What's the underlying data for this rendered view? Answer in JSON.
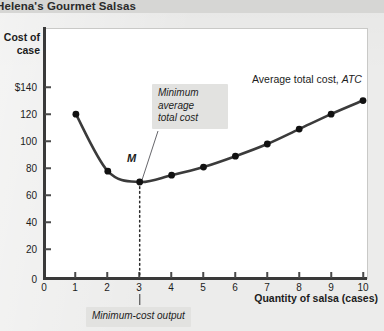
{
  "title": "Helena's Gourmet Salsas",
  "axes": {
    "y_title_line1": "Cost of",
    "y_title_line2": "case",
    "x_title": "Quantity of salsa (cases)",
    "y_ticks": [
      "$140",
      "120",
      "100",
      "80",
      "60",
      "40",
      "20",
      "0"
    ],
    "x_ticks": [
      "0",
      "1",
      "2",
      "3",
      "4",
      "5",
      "6",
      "7",
      "8",
      "9",
      "10"
    ]
  },
  "annotations": {
    "curve_label_plain": "Average total cost, ",
    "curve_label_italic": "ATC",
    "minimum_callout": "Minimum\naverage\ntotal cost",
    "point_label": "M",
    "min_output_callout": "Minimum-cost output"
  },
  "colors": {
    "page_background": "#ececeb",
    "title_bar": "#d6d6d4",
    "plot_background": "#ffffff",
    "curve": "#3b3b3b",
    "marker": "#111111",
    "axis": "#3a3a3a",
    "callout_background": "#e2e2e0"
  },
  "chart_data": {
    "type": "line",
    "title": "Helena's Gourmet Salsas",
    "xlabel": "Quantity of salsa (cases)",
    "ylabel": "Cost of case",
    "xlim": [
      0,
      10.6
    ],
    "ylim": [
      0,
      150
    ],
    "grid": false,
    "legend": "none",
    "series": [
      {
        "name": "Average total cost, ATC",
        "x": [
          1,
          2,
          3,
          4,
          5,
          6,
          7,
          8,
          9,
          10
        ],
        "values": [
          120,
          78,
          70,
          75,
          81,
          89,
          98,
          109,
          120,
          130
        ],
        "markers": true
      }
    ],
    "annotations": [
      {
        "label": "M",
        "x": 3,
        "y": 70,
        "note": "minimum average total cost point"
      },
      {
        "label": "Minimum-cost output",
        "x": 3,
        "note": "dotted vertical drop line from M to x-axis"
      }
    ]
  }
}
